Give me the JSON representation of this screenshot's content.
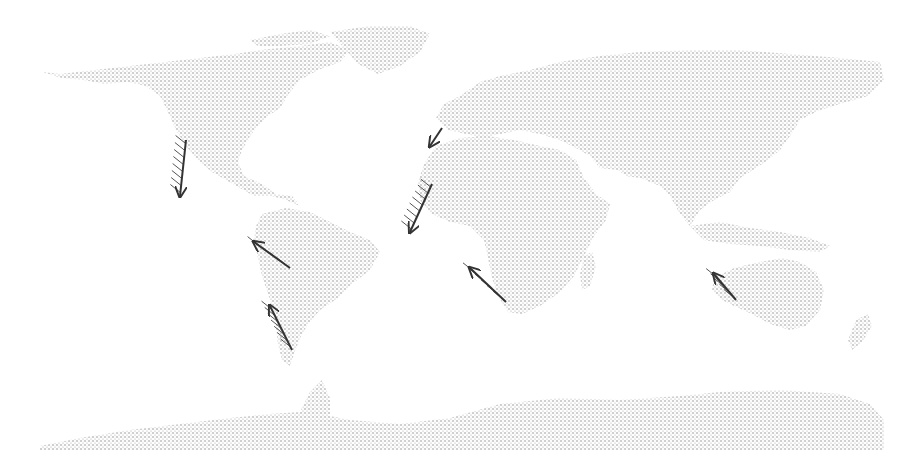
{
  "map": {
    "type": "world-map-stippled",
    "projection": "equirectangular",
    "land_color": "#b8b8b8",
    "background": "#ffffff",
    "arrow_color": "#333333",
    "hatch_color": "#555555",
    "continents": [
      {
        "name": "north-america",
        "points": "42,72 60,74 95,70 130,66 165,62 200,58 235,54 260,50 300,46 330,42 350,50 340,62 318,70 300,80 290,92 280,108 268,116 258,126 250,136 242,150 238,162 244,176 262,184 276,194 292,196 300,206 286,200 272,196 254,196 240,188 226,180 212,172 198,160 186,146 176,130 168,112 160,96 146,86 128,82 104,84 84,80 62,78"
      },
      {
        "name": "greenland",
        "points": "330,32 370,26 410,26 430,34 420,52 400,66 378,74 358,64 344,48"
      },
      {
        "name": "arctic-islands",
        "points": "250,40 280,34 310,30 330,36 310,44 280,46 258,46"
      },
      {
        "name": "south-america",
        "points": "262,214 286,208 310,212 330,222 350,232 370,240 380,252 370,270 352,284 338,298 320,310 308,324 300,338 294,354 290,366 282,360 278,344 276,326 274,310 268,294 262,276 258,258 254,240 256,226"
      },
      {
        "name": "europe-asia",
        "points": "460,96 480,82 500,76 530,70 560,62 600,56 640,52 690,50 740,50 790,54 840,58 880,62 884,80 868,96 840,104 820,110 800,120 790,136 780,150 768,160 756,168 740,178 730,192 714,200 700,210 690,226 680,214 670,196 660,186 640,178 626,176 618,170 600,168 590,156 576,148 560,140 540,134 520,130 500,134 482,138 466,134 448,130 436,118 444,104"
      },
      {
        "name": "africa",
        "points": "436,146 460,138 488,136 514,140 540,146 560,150 576,160 584,178 596,194 610,204 606,220 594,236 584,256 574,276 560,292 540,306 522,314 508,312 498,296 492,278 488,258 484,240 470,226 450,222 432,214 420,200 418,182 424,164"
      },
      {
        "name": "madagascar",
        "points": "584,256 592,252 596,266 590,286 582,290 580,274"
      },
      {
        "name": "southeast-asia-islands",
        "points": "690,226 720,222 750,228 780,232 810,238 830,246 820,252 790,250 760,246 730,244 704,240"
      },
      {
        "name": "australia",
        "points": "714,278 734,268 760,262 782,258 800,262 816,272 824,290 820,310 806,326 790,330 770,324 752,314 734,306 722,300 712,290"
      },
      {
        "name": "new-zealand",
        "points": "856,320 868,314 872,326 862,342 852,350 848,340"
      },
      {
        "name": "antarctica",
        "points": "40,446 80,438 130,430 180,424 230,418 270,414 300,412 310,392 322,380 330,398 330,416 350,420 400,424 450,418 500,404 560,398 620,400 680,396 720,392 780,390 840,394 870,404 884,420 884,450 40,450"
      }
    ],
    "currents": [
      {
        "name": "california-current",
        "x1": 186,
        "y1": 140,
        "x2": 180,
        "y2": 196,
        "hatch_side": "left",
        "hatch_x": 172,
        "hatch_y": 148,
        "hatch_len": 40
      },
      {
        "name": "canary-current-north",
        "x1": 442,
        "y1": 128,
        "x2": 430,
        "y2": 146,
        "hatch_side": "none",
        "hatch_x": 0,
        "hatch_y": 0,
        "hatch_len": 0
      },
      {
        "name": "canary-current-south",
        "x1": 432,
        "y1": 184,
        "x2": 410,
        "y2": 232,
        "hatch_side": "left",
        "hatch_x": 418,
        "hatch_y": 188,
        "hatch_len": 40
      },
      {
        "name": "humboldt-current-north",
        "x1": 290,
        "y1": 268,
        "x2": 254,
        "y2": 242,
        "hatch_side": "left",
        "hatch_x": 262,
        "hatch_y": 246,
        "hatch_len": 24
      },
      {
        "name": "humboldt-current-south",
        "x1": 292,
        "y1": 350,
        "x2": 270,
        "y2": 306,
        "hatch_side": "left",
        "hatch_x": 272,
        "hatch_y": 312,
        "hatch_len": 36
      },
      {
        "name": "benguela-current",
        "x1": 506,
        "y1": 302,
        "x2": 470,
        "y2": 268,
        "hatch_side": "left",
        "hatch_x": 478,
        "hatch_y": 276,
        "hatch_len": 30
      },
      {
        "name": "west-australian-current",
        "x1": 736,
        "y1": 300,
        "x2": 714,
        "y2": 274,
        "hatch_side": "left",
        "hatch_x": 716,
        "hatch_y": 272,
        "hatch_len": 24
      }
    ]
  }
}
